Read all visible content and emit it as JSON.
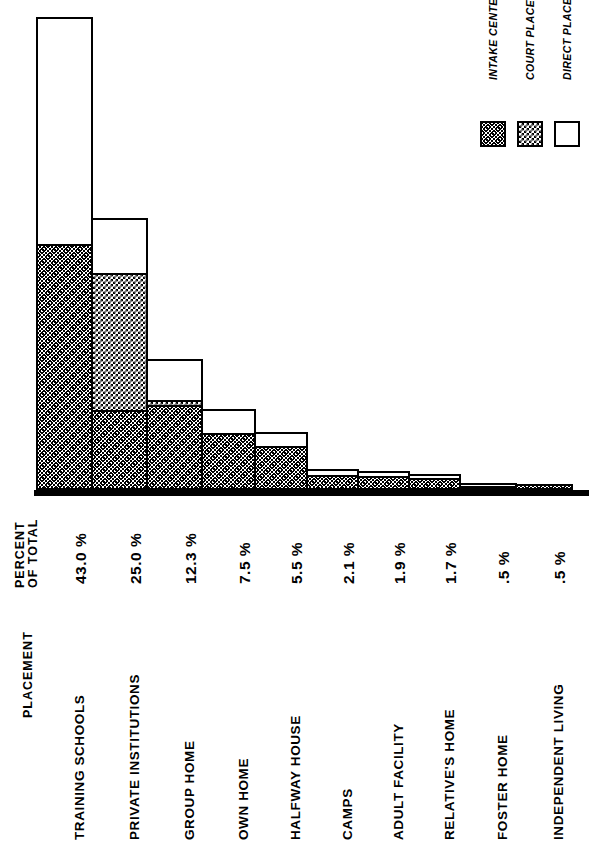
{
  "chart_data": {
    "type": "bar",
    "title": "",
    "subtitle": "",
    "orientation": "vertical-stacked",
    "stacked": true,
    "xlabel": "PLACEMENT",
    "ylabel": "PERCENT OF TOTAL",
    "grid": false,
    "legend_position": "top-right",
    "ylim": [
      0,
      43.0
    ],
    "categories": [
      "TRAINING SCHOOLS",
      "PRIVATE INSTITUTIONS",
      "GROUP HOME",
      "OWN HOME",
      "HALFWAY HOUSE",
      "CAMPS",
      "ADULT FACILITY",
      "RELATIVE'S HOME",
      "FOSTER HOME",
      "INDEPENDENT LIVING"
    ],
    "value_labels": [
      "43.0 %",
      "25.0 %",
      "12.3 %",
      "7.5 %",
      "5.5 %",
      "2.1 %",
      "1.9 %",
      "1.7 %",
      ".5 %",
      ".5 %"
    ],
    "totals": [
      43.0,
      25.0,
      12.3,
      7.5,
      5.5,
      2.1,
      1.9,
      1.7,
      0.5,
      0.5
    ],
    "series": [
      {
        "name": "INTAKE CENTER",
        "pattern": "stipple",
        "values": [
          22.3,
          7.3,
          7.7,
          5.2,
          4.0,
          1.4,
          1.3,
          1.1,
          0.2,
          0.5
        ]
      },
      {
        "name": "COURT PLACED",
        "pattern": "checker",
        "values": [
          0.0,
          12.6,
          0.7,
          0.0,
          0.0,
          0.0,
          0.0,
          0.0,
          0.0,
          0.0
        ]
      },
      {
        "name": "DIRECT PLACED",
        "pattern": "white",
        "values": [
          20.7,
          5.1,
          3.9,
          2.3,
          1.5,
          0.7,
          0.6,
          0.6,
          0.3,
          0.0
        ]
      }
    ],
    "bars": [
      {
        "category": "TRAINING SCHOOLS",
        "label": "43.0 %",
        "total": 43.0,
        "segments": [
          {
            "series": "INTAKE CENTER",
            "value": 22.3,
            "pattern": "intake"
          },
          {
            "series": "DIRECT PLACED",
            "value": 20.7,
            "pattern": "direct"
          }
        ]
      },
      {
        "category": "PRIVATE INSTITUTIONS",
        "label": "25.0 %",
        "total": 25.0,
        "segments": [
          {
            "series": "INTAKE CENTER",
            "value": 7.3,
            "pattern": "intake"
          },
          {
            "series": "COURT PLACED",
            "value": 12.6,
            "pattern": "court"
          },
          {
            "series": "DIRECT PLACED",
            "value": 5.1,
            "pattern": "direct"
          }
        ]
      },
      {
        "category": "GROUP HOME",
        "label": "12.3 %",
        "total": 12.3,
        "segments": [
          {
            "series": "INTAKE CENTER",
            "value": 7.7,
            "pattern": "intake"
          },
          {
            "series": "COURT PLACED",
            "value": 0.7,
            "pattern": "court"
          },
          {
            "series": "DIRECT PLACED",
            "value": 3.9,
            "pattern": "direct"
          }
        ]
      },
      {
        "category": "OWN HOME",
        "label": "7.5 %",
        "total": 7.5,
        "segments": [
          {
            "series": "INTAKE CENTER",
            "value": 5.2,
            "pattern": "intake"
          },
          {
            "series": "DIRECT PLACED",
            "value": 2.3,
            "pattern": "direct"
          }
        ]
      },
      {
        "category": "HALFWAY HOUSE",
        "label": "5.5 %",
        "total": 5.5,
        "segments": [
          {
            "series": "INTAKE CENTER",
            "value": 4.0,
            "pattern": "intake"
          },
          {
            "series": "DIRECT PLACED",
            "value": 1.5,
            "pattern": "direct"
          }
        ]
      },
      {
        "category": "CAMPS",
        "label": "2.1 %",
        "total": 2.1,
        "segments": [
          {
            "series": "INTAKE CENTER",
            "value": 1.4,
            "pattern": "intake"
          },
          {
            "series": "DIRECT PLACED",
            "value": 0.7,
            "pattern": "direct"
          }
        ]
      },
      {
        "category": "ADULT FACILITY",
        "label": "1.9 %",
        "total": 1.9,
        "segments": [
          {
            "series": "INTAKE CENTER",
            "value": 1.3,
            "pattern": "intake"
          },
          {
            "series": "DIRECT PLACED",
            "value": 0.6,
            "pattern": "direct"
          }
        ]
      },
      {
        "category": "RELATIVE'S HOME",
        "label": "1.7 %",
        "total": 1.7,
        "segments": [
          {
            "series": "INTAKE CENTER",
            "value": 1.1,
            "pattern": "intake"
          },
          {
            "series": "DIRECT PLACED",
            "value": 0.6,
            "pattern": "direct"
          }
        ]
      },
      {
        "category": "FOSTER HOME",
        "label": ".5 %",
        "total": 0.5,
        "segments": [
          {
            "series": "INTAKE CENTER",
            "value": 0.2,
            "pattern": "intake"
          },
          {
            "series": "DIRECT PLACED",
            "value": 0.3,
            "pattern": "direct"
          }
        ]
      },
      {
        "category": "INDEPENDENT LIVING",
        "label": ".5 %",
        "total": 0.5,
        "segments": [
          {
            "series": "INTAKE CENTER",
            "value": 0.5,
            "pattern": "intake"
          }
        ]
      }
    ]
  },
  "legend": {
    "items": [
      {
        "label": "INTAKE CENTER",
        "pattern": "intake"
      },
      {
        "label": "COURT PLACED",
        "pattern": "court"
      },
      {
        "label": "DIRECT PLACED",
        "pattern": "direct"
      }
    ]
  },
  "axes": {
    "value_axis_caption_line1": "PERCENT",
    "value_axis_caption_line2": "OF TOTAL",
    "category_axis_caption": "PLACEMENT"
  },
  "colors": {
    "ink": "#000000",
    "paper": "#ffffff"
  }
}
